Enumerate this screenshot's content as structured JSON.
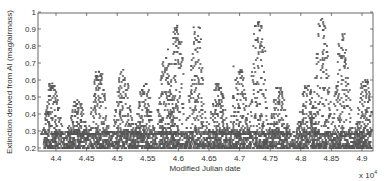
{
  "chart_data": {
    "type": "scatter",
    "title": "",
    "xlabel": "Modified Julian date",
    "ylabel": "Extinction derived from AI (mag/airmass)",
    "x_exponent_label": "x 10",
    "x_exponent_power": "4",
    "xlim": [
      4.37,
      4.92
    ],
    "ylim": [
      0.18,
      1.0
    ],
    "x_ticks": [
      4.4,
      4.45,
      4.5,
      4.55,
      4.6,
      4.65,
      4.7,
      4.75,
      4.8,
      4.85,
      4.9
    ],
    "x_tick_labels": [
      "4.4",
      "4.45",
      "4.5",
      "4.55",
      "4.6",
      "4.65",
      "4.7",
      "4.75",
      "4.8",
      "4.85",
      "4.9"
    ],
    "y_ticks": [
      0.2,
      0.3,
      0.4,
      0.5,
      0.6,
      0.7,
      0.8,
      0.9,
      1.0
    ],
    "y_tick_labels": [
      "0.2",
      "0.3",
      "0.4",
      "0.5",
      "0.6",
      "0.7",
      "0.8",
      "0.9",
      "1"
    ],
    "grid": false,
    "marker": "*",
    "marker_color": "#555555",
    "baseline_band": {
      "y_min": 0.2,
      "y_max": 0.3,
      "x_min": 4.38,
      "x_max": 4.915
    },
    "seasonal_peaks": [
      {
        "x": 4.394,
        "peak": 0.58
      },
      {
        "x": 4.435,
        "peak": 0.48
      },
      {
        "x": 4.47,
        "peak": 0.65
      },
      {
        "x": 4.51,
        "peak": 0.66
      },
      {
        "x": 4.545,
        "peak": 0.58
      },
      {
        "x": 4.58,
        "peak": 0.73
      },
      {
        "x": 4.598,
        "peak": 0.92
      },
      {
        "x": 4.63,
        "peak": 0.91
      },
      {
        "x": 4.665,
        "peak": 0.58
      },
      {
        "x": 4.7,
        "peak": 0.66
      },
      {
        "x": 4.73,
        "peak": 0.94
      },
      {
        "x": 4.765,
        "peak": 0.56
      },
      {
        "x": 4.81,
        "peak": 0.57
      },
      {
        "x": 4.835,
        "peak": 0.96
      },
      {
        "x": 4.868,
        "peak": 0.87
      },
      {
        "x": 4.905,
        "peak": 0.6
      }
    ],
    "notable_outliers": [
      {
        "x": 4.394,
        "y": 0.58
      },
      {
        "x": 4.47,
        "y": 0.65
      },
      {
        "x": 4.468,
        "y": 0.62
      },
      {
        "x": 4.51,
        "y": 0.66
      },
      {
        "x": 4.58,
        "y": 0.73
      },
      {
        "x": 4.583,
        "y": 0.78
      },
      {
        "x": 4.598,
        "y": 0.92
      },
      {
        "x": 4.598,
        "y": 0.91
      },
      {
        "x": 4.625,
        "y": 0.91
      },
      {
        "x": 4.633,
        "y": 0.91
      },
      {
        "x": 4.637,
        "y": 0.84
      },
      {
        "x": 4.628,
        "y": 0.78
      },
      {
        "x": 4.73,
        "y": 0.94
      },
      {
        "x": 4.733,
        "y": 0.89
      },
      {
        "x": 4.737,
        "y": 0.84
      },
      {
        "x": 4.74,
        "y": 0.79
      },
      {
        "x": 4.742,
        "y": 0.77
      },
      {
        "x": 4.835,
        "y": 0.96
      },
      {
        "x": 4.868,
        "y": 0.87
      },
      {
        "x": 4.872,
        "y": 0.76
      },
      {
        "x": 4.69,
        "y": 0.68
      },
      {
        "x": 4.905,
        "y": 0.6
      }
    ]
  }
}
